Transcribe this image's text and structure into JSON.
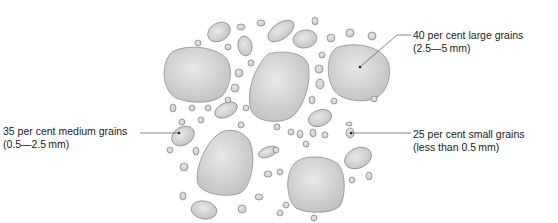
{
  "labels": {
    "large": {
      "line1": "40 per cent large grains",
      "line2": "(2.5—5 mm)"
    },
    "medium": {
      "line1": "35 per cent medium grains",
      "line2": "(0.5—2.5 mm)"
    },
    "small": {
      "line1": "25 per cent small grains",
      "line2": "(less than 0.5 mm)"
    }
  },
  "composition": [
    {
      "category": "large grains",
      "percent": 40,
      "size_range": "2.5—5 mm"
    },
    {
      "category": "medium grains",
      "percent": 35,
      "size_range": "0.5—2.5 mm"
    },
    {
      "category": "small grains",
      "percent": 25,
      "size_range": "less than 0.5 mm"
    }
  ],
  "colors": {
    "grain_fill_light": "#e6e6e6",
    "grain_fill_dark": "#c4c4c4",
    "grain_outline": "#8e8e8e",
    "text": "#222222",
    "leader_line": "#555555"
  }
}
